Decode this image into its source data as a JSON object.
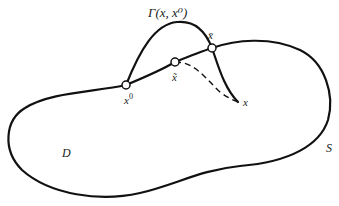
{
  "diagram": {
    "region_label": "D",
    "boundary_label": "S",
    "curve_label": "Γ(x, x⁰)",
    "points": {
      "start": {
        "label": "x",
        "superscript": "0"
      },
      "intersection_upper": {
        "label": "x̄"
      },
      "intersection_lower": {
        "label": "x̃"
      },
      "end": {
        "label": "x"
      }
    },
    "colors": {
      "stroke": "#111111",
      "background": "#ffffff"
    }
  }
}
